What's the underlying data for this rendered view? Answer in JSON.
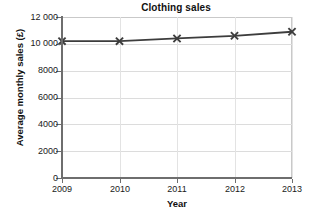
{
  "chart_data": {
    "type": "line",
    "title": "Clothing sales",
    "xlabel": "Year",
    "ylabel": "Average monthly sales (£)",
    "categories": [
      "2009",
      "2010",
      "2011",
      "2012",
      "2013"
    ],
    "x": [
      2009,
      2010,
      2011,
      2012,
      2013
    ],
    "values": [
      10200,
      10200,
      10400,
      10600,
      10900
    ],
    "series": [
      {
        "name": "Average monthly sales",
        "values": [
          10200,
          10200,
          10400,
          10600,
          10900
        ],
        "marker": "x-cross",
        "color": "#3d3d3d"
      }
    ],
    "xlim": [
      2009,
      2013
    ],
    "ylim": [
      0,
      12000
    ],
    "ytick_labels": [
      "0",
      "2000",
      "4000",
      "6000",
      "8000",
      "10 000",
      "12 000"
    ],
    "ytick_values": [
      0,
      2000,
      4000,
      6000,
      8000,
      10000,
      12000
    ],
    "xtick_labels": [
      "2009",
      "2010",
      "2011",
      "2012",
      "2013"
    ],
    "grid": "horizontal-and-vertical",
    "legend": "none",
    "annotations": []
  },
  "style": {
    "line_color": "#3d3d3d",
    "axis_color": "#6e6e6e",
    "grid_color": "#dcdcdc",
    "frame_color": "#c9c9c9",
    "background": "#ffffff",
    "text_color": "#1a1a1a"
  }
}
